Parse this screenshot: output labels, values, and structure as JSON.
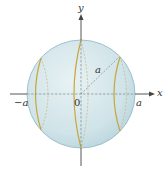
{
  "figure": {
    "type": "sphere-with-cross-sections",
    "colors": {
      "sphere_fill": "#cfe3e8",
      "sphere_edge": "#8fb8c4",
      "slice_curve": "#c9a53a",
      "axis": "#444444",
      "dashed": "#7a8a90"
    },
    "labels": {
      "x_axis": "x",
      "y_axis": "y",
      "neg_a": "−a",
      "origin": "0",
      "pos_a": "a",
      "radius": "a"
    }
  }
}
